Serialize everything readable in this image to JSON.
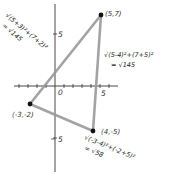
{
  "diagram": {
    "axes": {
      "x_tick_label": "5",
      "origin_label": "0",
      "y_tick_top_label": "5",
      "y_tick_bottom_label": "5"
    },
    "points": [
      {
        "label": "(5,7)",
        "x": 5,
        "y": 7
      },
      {
        "label": "(-3,-2)",
        "x": -3,
        "y": -2
      },
      {
        "label": "(4,-5)",
        "x": 4,
        "y": -5
      }
    ],
    "sides": {
      "left": {
        "expr": "√(5+3)²+(7+2)²",
        "result": "= √145"
      },
      "right": {
        "expr": "√(5-4)²+(7+5)²",
        "result": "= √145"
      },
      "bottom": {
        "expr": "√(-3-4)²+(-2+5)²",
        "result": "= √58"
      }
    },
    "colors": {
      "triangle_side": "#9a9a9a",
      "point": "#111111",
      "axis": "#333333"
    }
  }
}
